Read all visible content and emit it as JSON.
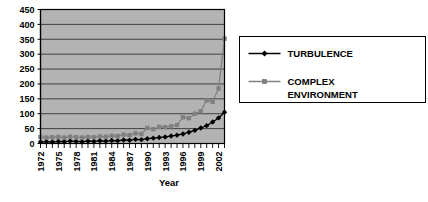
{
  "chart_data": {
    "type": "line",
    "title": "",
    "xlabel": "Year",
    "ylabel": "",
    "grid": true,
    "legend_position": "right",
    "plot_background": "#b3b3b3",
    "xlim": [
      1972,
      2003
    ],
    "ylim": [
      0,
      450
    ],
    "ytick_step": 50,
    "ytick_labels": [
      "0",
      "50",
      "100",
      "150",
      "200",
      "250",
      "300",
      "350",
      "400",
      "450"
    ],
    "ytick_values": [
      0,
      50,
      100,
      150,
      200,
      250,
      300,
      350,
      400,
      450
    ],
    "xtick_labels": [
      "1972",
      "1975",
      "1978",
      "1981",
      "1984",
      "1987",
      "1990",
      "1993",
      "1996",
      "1999",
      "2002"
    ],
    "xtick_values": [
      1972,
      1975,
      1978,
      1981,
      1984,
      1987,
      1990,
      1993,
      1996,
      1999,
      2002
    ],
    "x": [
      1972,
      1973,
      1974,
      1975,
      1976,
      1977,
      1978,
      1979,
      1980,
      1981,
      1982,
      1983,
      1984,
      1985,
      1986,
      1987,
      1988,
      1989,
      1990,
      1991,
      1992,
      1993,
      1994,
      1995,
      1996,
      1997,
      1998,
      1999,
      2000,
      2001,
      2002,
      2003
    ],
    "series": [
      {
        "name": "TURBULENCE",
        "color": "#000000",
        "marker": "diamond",
        "values": [
          5,
          6,
          5,
          7,
          6,
          8,
          7,
          6,
          8,
          7,
          9,
          8,
          10,
          9,
          12,
          11,
          14,
          13,
          16,
          18,
          20,
          22,
          25,
          28,
          32,
          38,
          44,
          52,
          60,
          72,
          86,
          105
        ]
      },
      {
        "name": "COMPLEX ENVIRONMENT",
        "color": "#808080",
        "marker": "square",
        "values": [
          22,
          20,
          21,
          22,
          20,
          23,
          21,
          20,
          22,
          21,
          24,
          23,
          26,
          25,
          30,
          28,
          34,
          32,
          52,
          48,
          56,
          55,
          58,
          62,
          88,
          85,
          100,
          108,
          145,
          140,
          185,
          352
        ]
      }
    ]
  },
  "legend": {
    "entries": [
      {
        "label": "TURBULENCE",
        "color": "#000000",
        "marker": "diamond"
      },
      {
        "label": "COMPLEX",
        "label2": "ENVIRONMENT",
        "color": "#808080",
        "marker": "square"
      }
    ]
  }
}
